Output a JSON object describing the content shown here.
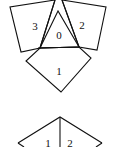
{
  "diagram": {
    "colors": {
      "stroke": "#111111",
      "background": "#ffffff"
    },
    "top_figure": {
      "pieces": [
        {
          "label": "0",
          "shape": "triangle",
          "points": "58,11 40,48 79,47",
          "label_pos": [
            59,
            36
          ]
        },
        {
          "label": "1",
          "shape": "square",
          "points": "40,48 79,47 91,58 61,92 26,61",
          "label_pos": [
            59,
            74
          ]
        },
        {
          "label": "2",
          "shape": "square",
          "points": "62,0 106,7 97,50 79,47",
          "label_pos": [
            82,
            27
          ]
        },
        {
          "label": "3",
          "shape": "square",
          "points": "55,0 10,7 21,52 40,48",
          "label_pos": [
            35,
            26
          ]
        }
      ]
    },
    "bottom_figure": {
      "pieces": [
        {
          "label": "1",
          "label_pos": [
            47,
            145
          ]
        },
        {
          "label": "2",
          "label_pos": [
            71,
            145
          ]
        }
      ],
      "outline": "18,147 60,117 101,147",
      "divider": "60,117 60,147"
    }
  }
}
